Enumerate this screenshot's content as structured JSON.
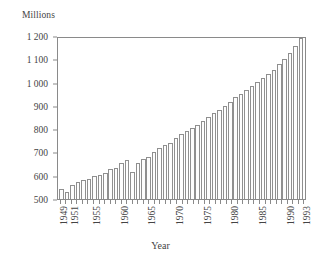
{
  "chart_data": {
    "type": "bar",
    "title": "",
    "subtitle": "",
    "units_label": "Millions",
    "xlabel": "Year",
    "ylabel": "",
    "ylim": [
      500,
      1200
    ],
    "ytick_values": [
      500,
      600,
      700,
      800,
      900,
      1000,
      1100,
      1200
    ],
    "ytick_labels": [
      "500",
      "600",
      "700",
      "800",
      "900",
      "1 000",
      "1 100",
      "1 200"
    ],
    "xtick_labels": [
      "1949",
      "1951",
      "1955",
      "1960",
      "1965",
      "1970",
      "1975",
      "1980",
      "1985",
      "1990",
      "1993"
    ],
    "grid": false,
    "legend": null,
    "bar_fill_color": "#fdfdfd",
    "bar_edge_color": "#8f8f8f",
    "axis_color": "#8a8a8a",
    "categories": [
      "1949",
      "1950",
      "1951",
      "1952",
      "1953",
      "1954",
      "1955",
      "1956",
      "1957",
      "1958",
      "1959",
      "1960",
      "1961",
      "1962",
      "1963",
      "1964",
      "1965",
      "1966",
      "1967",
      "1968",
      "1969",
      "1970",
      "1971",
      "1972",
      "1973",
      "1974",
      "1975",
      "1976",
      "1977",
      "1978",
      "1979",
      "1980",
      "1981",
      "1982",
      "1983",
      "1984",
      "1985",
      "1986",
      "1987",
      "1988",
      "1989",
      "1990",
      "1991",
      "1992",
      "1993"
    ],
    "values": [
      543,
      528,
      560,
      572,
      582,
      588,
      600,
      604,
      612,
      628,
      632,
      656,
      668,
      618,
      654,
      672,
      680,
      700,
      718,
      730,
      742,
      762,
      780,
      792,
      806,
      820,
      836,
      854,
      870,
      884,
      900,
      918,
      936,
      952,
      968,
      986,
      1002,
      1020,
      1038,
      1056,
      1078,
      1100,
      1126,
      1156,
      1192
    ]
  }
}
